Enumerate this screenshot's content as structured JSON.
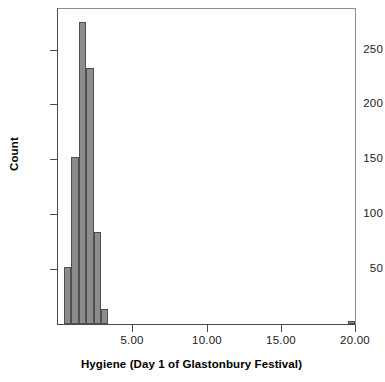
{
  "chart_data": {
    "type": "bar",
    "title": "",
    "subtitle": "",
    "xlabel": "Hygiene (Day 1 of Glastonbury Festival)",
    "ylabel": "Count",
    "xlim": [
      0,
      20
    ],
    "ylim": [
      0,
      287
    ],
    "grid": false,
    "legend": false,
    "bin_width": 0.5,
    "bar_color": "#8c8c8c",
    "bar_edge_color": "#4f4f4f",
    "axis_color": "#4a4a4a",
    "x_ticks": [
      {
        "value": 5,
        "label": "5.00"
      },
      {
        "value": 10,
        "label": "10.00"
      },
      {
        "value": 15,
        "label": "15.00"
      },
      {
        "value": 20,
        "label": "20.00"
      }
    ],
    "y_ticks": [
      {
        "value": 50,
        "label": "50"
      },
      {
        "value": 100,
        "label": "100"
      },
      {
        "value": 150,
        "label": "150"
      },
      {
        "value": 200,
        "label": "200"
      },
      {
        "value": 250,
        "label": "250"
      }
    ],
    "bins": [
      {
        "x_start": 0.4,
        "x_end": 0.9,
        "center": 0.65,
        "count": 52
      },
      {
        "x_start": 0.9,
        "x_end": 1.4,
        "center": 1.15,
        "count": 152
      },
      {
        "x_start": 1.4,
        "x_end": 1.9,
        "center": 1.65,
        "count": 275
      },
      {
        "x_start": 1.9,
        "x_end": 2.4,
        "center": 2.15,
        "count": 233
      },
      {
        "x_start": 2.4,
        "x_end": 2.9,
        "center": 2.65,
        "count": 84
      },
      {
        "x_start": 2.9,
        "x_end": 3.4,
        "center": 3.15,
        "count": 14
      },
      {
        "x_start": 19.5,
        "x_end": 20.0,
        "center": 19.75,
        "count": 3
      }
    ],
    "categories": [
      "0.65",
      "1.15",
      "1.65",
      "2.15",
      "2.65",
      "3.15",
      "19.75"
    ],
    "values": [
      52,
      152,
      275,
      233,
      84,
      14,
      3
    ]
  }
}
